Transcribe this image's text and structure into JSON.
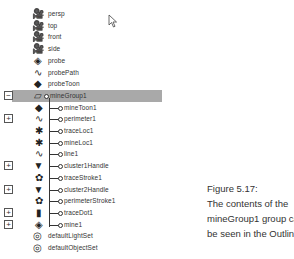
{
  "outliner": {
    "items": [
      {
        "label": "persp",
        "icon": "camera-icon",
        "level": 0,
        "expander": ""
      },
      {
        "label": "top",
        "icon": "camera-icon",
        "level": 0,
        "expander": ""
      },
      {
        "label": "front",
        "icon": "camera-icon",
        "level": 0,
        "expander": ""
      },
      {
        "label": "side",
        "icon": "camera-icon",
        "level": 0,
        "expander": ""
      },
      {
        "label": "probe",
        "icon": "mesh-icon",
        "level": 0,
        "expander": ""
      },
      {
        "label": "probePath",
        "icon": "curve-icon",
        "level": 0,
        "expander": ""
      },
      {
        "label": "probeToon",
        "icon": "toon-icon",
        "level": 0,
        "expander": ""
      },
      {
        "label": "mineGroup1",
        "icon": "group-icon",
        "level": 0,
        "expander": "−",
        "selected": true
      },
      {
        "label": "mineToon1",
        "icon": "toon-icon",
        "level": 1,
        "expander": ""
      },
      {
        "label": "perimeter1",
        "icon": "curve-icon",
        "level": 1,
        "expander": "+"
      },
      {
        "label": "traceLoc1",
        "icon": "locator-icon",
        "level": 1,
        "expander": ""
      },
      {
        "label": "mineLoc1",
        "icon": "locator-icon",
        "level": 1,
        "expander": ""
      },
      {
        "label": "line1",
        "icon": "curve-icon",
        "level": 1,
        "expander": ""
      },
      {
        "label": "cluster1Handle",
        "icon": "cluster-icon",
        "level": 1,
        "expander": "+"
      },
      {
        "label": "traceStroke1",
        "icon": "stroke-icon",
        "level": 1,
        "expander": ""
      },
      {
        "label": "cluster2Handle",
        "icon": "cluster-icon",
        "level": 1,
        "expander": "+"
      },
      {
        "label": "perimeterStroke1",
        "icon": "stroke-icon",
        "level": 1,
        "expander": ""
      },
      {
        "label": "traceDot1",
        "icon": "surface-icon",
        "level": 1,
        "expander": "+"
      },
      {
        "label": "mine1",
        "icon": "mesh-icon",
        "level": 1,
        "expander": "+"
      },
      {
        "label": "defaultLightSet",
        "icon": "set-icon",
        "level": 0,
        "expander": ""
      },
      {
        "label": "defaultObjectSet",
        "icon": "set-icon",
        "level": 0,
        "expander": ""
      }
    ]
  },
  "caption": {
    "lines": [
      "Figure 5.17:",
      "The contents of the",
      "mineGroup1 group can",
      "be seen in the Outliner."
    ]
  },
  "icons": {
    "camera-icon": "🎥",
    "mesh-icon": "◈",
    "curve-icon": "∿",
    "toon-icon": "◆",
    "group-icon": "▱",
    "locator-icon": "✱",
    "cluster-icon": "▼",
    "stroke-icon": "✿",
    "surface-icon": "▮",
    "set-icon": "◎"
  }
}
